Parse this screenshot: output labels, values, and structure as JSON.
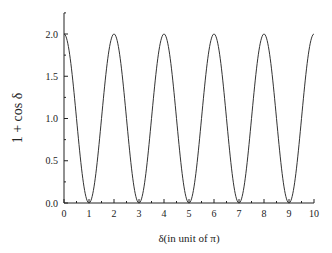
{
  "chart_data": {
    "type": "line",
    "title": "",
    "xlabel": "δ(in unit of π)",
    "ylabel": "1 + cos δ",
    "xlim": [
      0,
      10
    ],
    "ylim": [
      0,
      2.2
    ],
    "xticks": [
      "0",
      "1",
      "2",
      "3",
      "4",
      "5",
      "6",
      "7",
      "8",
      "9",
      "10"
    ],
    "yticks": [
      "0.0",
      "0.5",
      "1.0",
      "1.5",
      "2.0"
    ],
    "grid": false,
    "legend": null,
    "series": [
      {
        "name": "1 + cos δ",
        "function": "1 + cos(pi * x)",
        "x": [
          0,
          0.5,
          1,
          1.5,
          2,
          2.5,
          3,
          3.5,
          4,
          4.5,
          5,
          5.5,
          6,
          6.5,
          7,
          7.5,
          8,
          8.5,
          9,
          9.5,
          10
        ],
        "values": [
          2.0,
          1.0,
          0.0,
          1.0,
          2.0,
          1.0,
          0.0,
          1.0,
          2.0,
          1.0,
          0.0,
          1.0,
          2.0,
          1.0,
          0.0,
          1.0,
          2.0,
          1.0,
          0.0,
          1.0,
          2.0
        ]
      }
    ],
    "colors": {
      "line": "#333333",
      "axis": "#222222"
    }
  }
}
